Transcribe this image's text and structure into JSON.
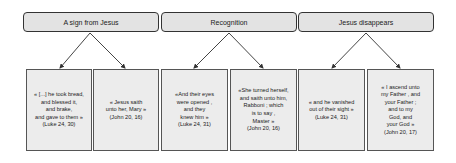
{
  "headers": [
    {
      "label": "A sign from Jesus"
    },
    {
      "label": "Recognition"
    },
    {
      "label": "Jesus disappears"
    }
  ],
  "cards": [
    {
      "text": "« [...] he took bread,\nand blessed it,\nand brake,\nand gave to  them »\n(Luke 24, 30)"
    },
    {
      "text": "« Jesus  saith\nunto her, Mary »\n(John 20, 16)"
    },
    {
      "text": "«And their eyes\nwere opened ,\nand they\nknew him »\n(Luke 24, 31)"
    },
    {
      "text": "«She turned  herself,\nand saith unto him,\nRabboni ; which\nis to say ,\nMaster »\n(John 20, 16)"
    },
    {
      "text": "« and he vanished\nout of  their sight »\n(Luke 24, 31)"
    },
    {
      "text": "« I ascend unto\nmy Father , and\nyour Father ;\nand to  my\nGod, and\nyour God »\n(John 20, 17)"
    }
  ],
  "colors": {
    "header_fill": "#e3e3e3",
    "card_fill": "#ececec",
    "stroke": "#333333"
  }
}
